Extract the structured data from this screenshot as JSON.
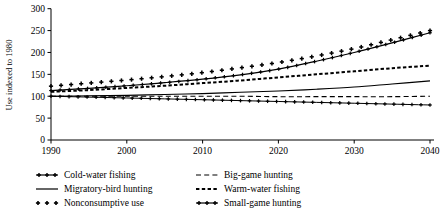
{
  "chart_data": {
    "type": "line",
    "title": "",
    "xlabel": "",
    "ylabel": "Use indexed to 1980",
    "xlim": [
      1990,
      2040
    ],
    "ylim": [
      0,
      300
    ],
    "grid": false,
    "legend_position": "below-left",
    "xticks": [
      1990,
      2000,
      2010,
      2020,
      2030,
      2040
    ],
    "yticks": [
      0,
      50,
      100,
      150,
      200,
      250,
      300
    ],
    "x": [
      1990,
      1995,
      2000,
      2005,
      2010,
      2015,
      2020,
      2025,
      2030,
      2035,
      2040
    ],
    "series": [
      {
        "name": "Cold-water fishing",
        "style": "solid-plus",
        "values": [
          113,
          118,
          124,
          131,
          139,
          149,
          162,
          180,
          200,
          222,
          245
        ]
      },
      {
        "name": "Migratory-bird hunting",
        "style": "solid",
        "values": [
          100,
          101,
          102,
          104,
          106,
          109,
          112,
          116,
          121,
          128,
          135
        ]
      },
      {
        "name": "Nonconsumptive use",
        "style": "plus-markers",
        "values": [
          123,
          130,
          137,
          145,
          154,
          165,
          177,
          192,
          209,
          229,
          250
        ]
      },
      {
        "name": "Big-game hunting",
        "style": "dashed",
        "values": [
          100,
          100,
          100,
          100,
          100,
          100,
          99,
          99,
          99,
          99,
          100
        ]
      },
      {
        "name": "Warm-water fishing",
        "style": "dotted-thick",
        "values": [
          110,
          114,
          119,
          124,
          130,
          136,
          143,
          150,
          157,
          164,
          170
        ]
      },
      {
        "name": "Small-game hunting",
        "style": "line-plus",
        "values": [
          100,
          98,
          96,
          94,
          92,
          90,
          88,
          86,
          84,
          82,
          80
        ]
      }
    ],
    "colors": {
      "axis": "#000000",
      "series": "#000000",
      "background": "#ffffff"
    }
  },
  "legend": {
    "column1": [
      {
        "label": "Cold-water fishing",
        "marker": "solid-plus"
      },
      {
        "label": "Migratory-bird hunting",
        "marker": "solid"
      },
      {
        "label": "Nonconsumptive use",
        "marker": "plus-markers"
      }
    ],
    "column2": [
      {
        "label": "Big-game hunting",
        "marker": "dashed"
      },
      {
        "label": "Warm-water fishing",
        "marker": "dotted-thick"
      },
      {
        "label": "Small-game hunting",
        "marker": "line-plus"
      }
    ]
  }
}
